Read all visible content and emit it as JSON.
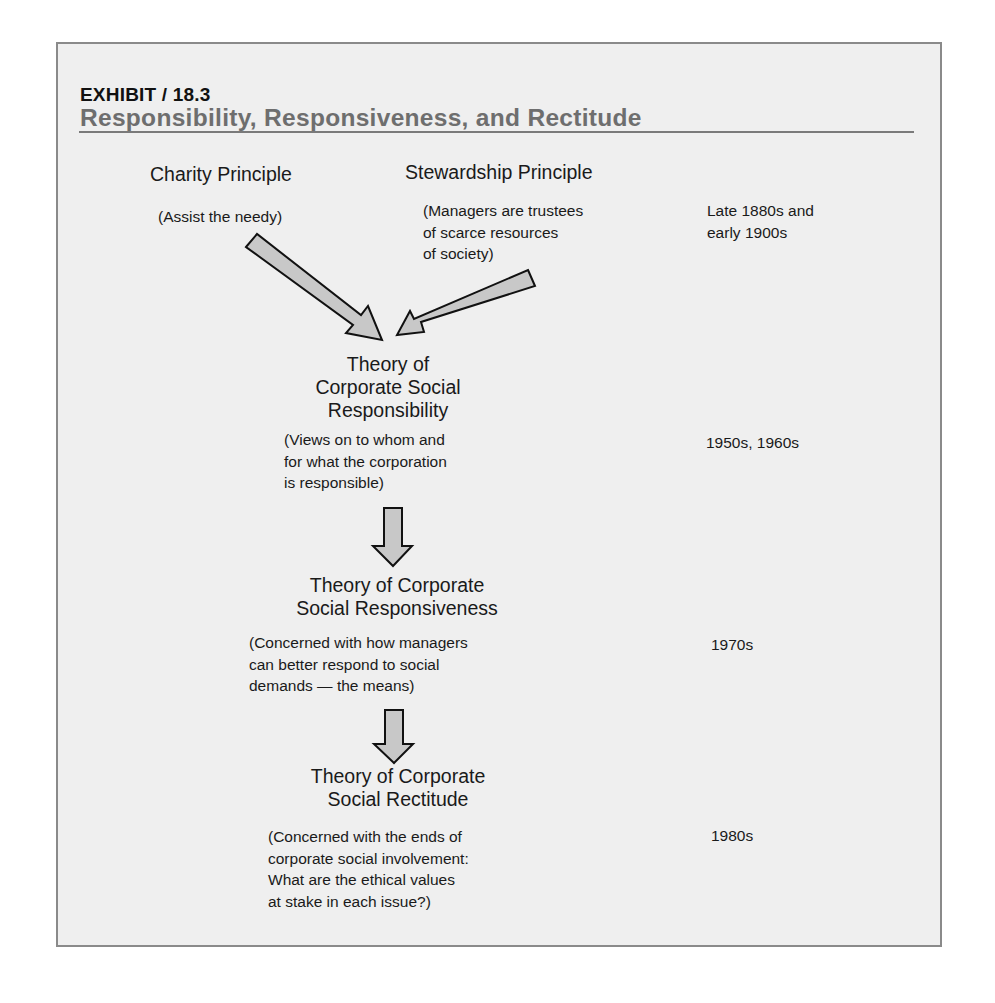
{
  "exhibit": {
    "label": "EXHIBIT / 18.3",
    "title": "Responsibility, Responsiveness, and Rectitude"
  },
  "colors": {
    "panel_background": "#efefef",
    "panel_border": "#8a8a8a",
    "title_grey": "#6e6e6e",
    "arrow_fill": "#c8c8c8",
    "arrow_stroke": "#111111"
  },
  "principles": [
    {
      "name": "Charity Principle",
      "description": [
        "(Assist the needy)"
      ]
    },
    {
      "name": "Stewardship Principle",
      "description": [
        "(Managers are trustees",
        "of scarce resources",
        "of society)"
      ]
    }
  ],
  "theories": [
    {
      "heading": [
        "Theory of",
        "Corporate Social",
        "Responsibility"
      ],
      "description": [
        "(Views on to whom and",
        "for what the corporation",
        "is responsible)"
      ],
      "era": [
        "1950s, 1960s"
      ]
    },
    {
      "heading": [
        "Theory of Corporate",
        "Social Responsiveness"
      ],
      "description": [
        "(Concerned with how managers",
        "can better respond to social",
        "demands — the means)"
      ],
      "era": [
        "1970s"
      ]
    },
    {
      "heading": [
        "Theory of Corporate",
        "Social Rectitude"
      ],
      "description": [
        "(Concerned with the ends of",
        "corporate social involvement:",
        "What are the ethical values",
        "at stake in each issue?)"
      ],
      "era": [
        "1980s"
      ]
    }
  ],
  "principles_era": [
    "Late 1880s and",
    "early 1900s"
  ],
  "arrows": [
    {
      "id": "charity-to-csr",
      "direction": "down-right"
    },
    {
      "id": "stewardship-to-csr",
      "direction": "down-left"
    },
    {
      "id": "csr-to-responsiveness",
      "direction": "down"
    },
    {
      "id": "responsiveness-to-rectitude",
      "direction": "down"
    }
  ]
}
